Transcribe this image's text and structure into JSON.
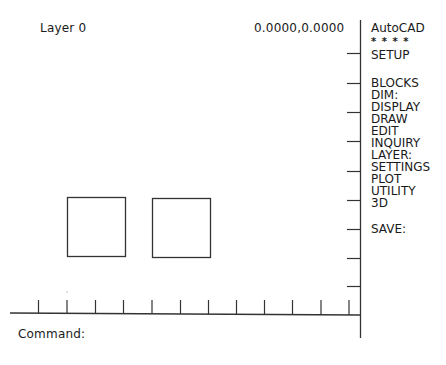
{
  "status": {
    "layer": "Layer 0",
    "coordinates": "0.0000,0.0000"
  },
  "screen_menu": {
    "title": "AutoCAD",
    "separator": "* * * *",
    "items": [
      {
        "label": "SETUP",
        "top": 34
      },
      {
        "label": "BLOCKS",
        "top": 62
      },
      {
        "label": "DIM:",
        "top": 74
      },
      {
        "label": "DISPLAY",
        "top": 86
      },
      {
        "label": "DRAW",
        "top": 98
      },
      {
        "label": "EDIT",
        "top": 110
      },
      {
        "label": "INQUIRY",
        "top": 122
      },
      {
        "label": "LAYER:",
        "top": 134
      },
      {
        "label": "SETTINGS",
        "top": 146
      },
      {
        "label": "PLOT",
        "top": 158
      },
      {
        "label": "UTILITY",
        "top": 170
      },
      {
        "label": "3D",
        "top": 182
      },
      {
        "label": "SAVE:",
        "top": 209
      }
    ]
  },
  "command_line": {
    "prompt": "Command:",
    "value": ""
  },
  "drawing": {
    "entities": [
      {
        "type": "rectangle",
        "x": 67,
        "y": 197,
        "w": 58,
        "h": 59
      },
      {
        "type": "rectangle",
        "x": 152,
        "y": 198,
        "w": 58,
        "h": 59
      }
    ],
    "stroke_color": "#333333"
  }
}
